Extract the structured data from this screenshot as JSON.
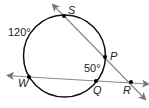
{
  "diagram": {
    "type": "circle-secant-geometry",
    "circle": {
      "cx": 64.5,
      "cy": 56,
      "r": 41,
      "stroke": "#111111"
    },
    "secants": [
      {
        "name": "secant-SR",
        "through": [
          "S",
          "P",
          "R"
        ]
      },
      {
        "name": "secant-WR",
        "through": [
          "W",
          "Q",
          "R"
        ]
      }
    ],
    "points": [
      {
        "id": "S",
        "label": "S",
        "x": 64,
        "y": 16
      },
      {
        "id": "P",
        "label": "P",
        "x": 105,
        "y": 57
      },
      {
        "id": "Q",
        "label": "Q",
        "x": 96,
        "y": 81
      },
      {
        "id": "W",
        "label": "W",
        "x": 29,
        "y": 77
      },
      {
        "id": "R",
        "label": "R",
        "x": 131,
        "y": 82
      }
    ],
    "arcs": [
      {
        "name": "arc-SW",
        "measure": "120°"
      },
      {
        "name": "arc-PQ",
        "measure": "50°"
      }
    ],
    "line_color": "#888888",
    "point_color": "#000000"
  }
}
